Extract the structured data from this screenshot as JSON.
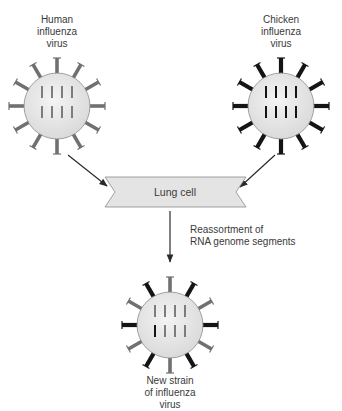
{
  "labels": {
    "human_virus": "Human\ninfluenza\nvirus",
    "chicken_virus": "Chicken\ninfluenza\nvirus",
    "lung_cell": "Lung cell",
    "reassortment": "Reassortment of\nRNA genome segments",
    "new_strain": "New strain\nof influenza\nvirus"
  },
  "colors": {
    "human": "#707070",
    "chicken": "#141414",
    "virus_body": "#e6e6e6",
    "lung_cell_fill": "#e4e4e4",
    "arrow": "#2a2a2a"
  },
  "viruses": {
    "human": {
      "cx": 57,
      "cy": 106,
      "spikes": [
        "h",
        "h",
        "h",
        "h",
        "h",
        "h",
        "h",
        "h",
        "h",
        "h",
        "h",
        "h"
      ],
      "rna": [
        "h",
        "h",
        "h",
        "h",
        "h",
        "h",
        "h",
        "h"
      ]
    },
    "chicken": {
      "cx": 281,
      "cy": 106,
      "spikes": [
        "c",
        "c",
        "c",
        "c",
        "c",
        "c",
        "c",
        "c",
        "c",
        "c",
        "c",
        "c"
      ],
      "rna": [
        "c",
        "c",
        "c",
        "c",
        "c",
        "c",
        "c",
        "c"
      ]
    },
    "new_strain": {
      "cx": 170,
      "cy": 325,
      "spikes": [
        "h",
        "c",
        "h",
        "c",
        "h",
        "c",
        "h",
        "c",
        "h",
        "c",
        "h",
        "c"
      ],
      "rna": [
        "h",
        "h",
        "h",
        "h",
        "c",
        "h",
        "h",
        "h"
      ]
    }
  }
}
